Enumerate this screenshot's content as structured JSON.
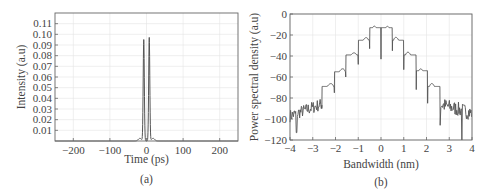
{
  "chart_data": [
    {
      "id": "a",
      "type": "line",
      "caption": "(a)",
      "xlabel": "Time (ps)",
      "ylabel": "Intensity (a.u)",
      "xlim": [
        -250,
        250
      ],
      "ylim": [
        0,
        0.12
      ],
      "xticks": [
        -200,
        -100,
        0,
        100,
        200
      ],
      "xtick_labels": [
        "−200",
        "−100",
        "0",
        "100",
        "200"
      ],
      "yticks": [
        0.01,
        0.02,
        0.03,
        0.04,
        0.05,
        0.06,
        0.07,
        0.08,
        0.09,
        0.1,
        0.11
      ],
      "ytick_labels": [
        "0.01",
        "0.02",
        "0.03",
        "0.04",
        "0.05",
        "0.06",
        "0.07",
        "0.08",
        "0.09",
        "0.10",
        "0.11"
      ],
      "grid": true,
      "series": [
        {
          "name": "intensity",
          "x": [
            -250,
            -40,
            -30,
            -22,
            -16,
            -12,
            -9,
            -7,
            -5,
            -3,
            0,
            3,
            5,
            7,
            9,
            12,
            16,
            22,
            30,
            40,
            250
          ],
          "y": [
            0,
            0,
            0.0005,
            0.002,
            0.003,
            0.03,
            0.095,
            0.05,
            0.01,
            0.001,
            0.0,
            0.001,
            0.01,
            0.05,
            0.097,
            0.03,
            0.003,
            0.002,
            0.0005,
            0,
            0
          ]
        }
      ],
      "annotations": [
        "Two narrow peaks near −7 ps (~0.095) and +7 ps (~0.097)"
      ]
    },
    {
      "id": "b",
      "type": "line",
      "caption": "(b)",
      "xlabel": "Bandwidth (nm)",
      "ylabel": "Power spectral density (a.u)",
      "xlim": [
        -4,
        4
      ],
      "ylim": [
        -120,
        0
      ],
      "xticks": [
        -4,
        -3,
        -2,
        -1,
        0,
        1,
        2,
        3,
        4
      ],
      "xtick_labels": [
        "−4",
        "−3",
        "−2",
        "−1",
        "0",
        "1",
        "2",
        "3",
        "4"
      ],
      "yticks": [
        0,
        -20,
        -40,
        -60,
        -80,
        -100,
        -120
      ],
      "ytick_labels": [
        "0",
        "−20",
        "−40",
        "−60",
        "−80",
        "−100",
        "−120"
      ],
      "grid": true,
      "series": [
        {
          "name": "psd",
          "lobe_peaks_x": [
            -2.25,
            -1.75,
            -1.2,
            -0.7,
            -0.2,
            0.2,
            0.7,
            1.2,
            1.75,
            2.25
          ],
          "lobe_peaks_y": [
            -68,
            -54,
            -38,
            -24,
            -12,
            -12,
            -24,
            -38,
            -53,
            -68
          ],
          "nulls_x": [
            -2.6,
            -2.05,
            -1.55,
            -1.0,
            -0.5,
            0.0,
            0.5,
            1.0,
            1.55,
            2.05,
            2.6
          ],
          "nulls_y": [
            -90,
            -75,
            -60,
            -48,
            -33,
            -43,
            -35,
            -53,
            -72,
            -85,
            -106
          ],
          "noise_floor": [
            {
              "x_range": [
                -4,
                -2.6
              ],
              "y_approx": -95,
              "y_range": [
                -114,
                -80
              ]
            },
            {
              "x_range": [
                2.6,
                4
              ],
              "y_approx": -92,
              "y_range": [
                -120,
                -80
              ]
            }
          ]
        }
      ]
    }
  ],
  "panels": {
    "a": {
      "caption": "(a)",
      "xlabel": "Time (ps)",
      "ylabel": "Intensity (a.u)"
    },
    "b": {
      "caption": "(b)",
      "xlabel": "Bandwidth (nm)",
      "ylabel": "Power spectral density (a.u)"
    }
  },
  "colors": {
    "line": "#555555",
    "grid": "#e4e4e4",
    "frame": "#666666",
    "text": "#444444"
  }
}
